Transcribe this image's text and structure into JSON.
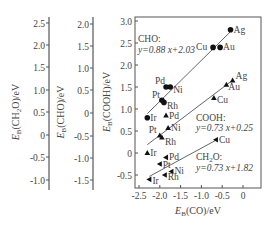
{
  "chart_data": {
    "type": "scatter",
    "title": "",
    "xlabel": "E_B(CO)/eV",
    "xlabel_main": "E",
    "xlabel_sub": "B",
    "xlabel_rest": "(CO)/eV",
    "xlim": [
      -2.5,
      0.4
    ],
    "xticks": [
      -2.5,
      -2.0,
      -1.5,
      -1.0,
      -0.5,
      0
    ],
    "xtick_labels": [
      "-2.5",
      "-2.0",
      "-1.5",
      "-1.0",
      "-0.5",
      "0"
    ],
    "axes": [
      {
        "name": "CH2O",
        "label_main": "E",
        "label_sub": "B",
        "label_rest": "(CH",
        "label_sub2": "2",
        "label_rest2": "O)/eV",
        "ylabel": "E_B(CH2O)/eV",
        "ticks": [
          "2.5",
          "2.0",
          "1.5",
          "1.0",
          "0.5",
          "0",
          "-0.5",
          "-1.0"
        ]
      },
      {
        "name": "CHO",
        "label_main": "E",
        "label_sub": "B",
        "label_rest": "(CHO)/eV",
        "ylabel": "E_B(CHO)/eV",
        "ticks": [
          "2.0",
          "1.5",
          "1.0",
          "0.5",
          "0",
          "-0.5",
          "-1.0",
          "-1.5"
        ]
      },
      {
        "name": "COOH",
        "label_main": "E",
        "label_sub": "B",
        "label_rest": "(COOH)/eV",
        "ylabel": "E_B(COOH)/eV",
        "ticks": [
          "3.0",
          "2.5",
          "2.0",
          "1.5",
          "1.0",
          "0.5",
          "0",
          "-0.5"
        ],
        "ylim": [
          -0.75,
          3.05
        ]
      }
    ],
    "series": [
      {
        "name": "CHO",
        "marker": "circle",
        "fit_label_1": "CHO:",
        "fit_label_2": "y=0.88 x+2.03",
        "fit": {
          "slope": 0.88,
          "intercept": 2.03
        },
        "points": [
          {
            "label": "Ag",
            "x": -0.3,
            "y": 2.8
          },
          {
            "label": "Au",
            "x": -0.55,
            "y": 2.4
          },
          {
            "label": "Cu",
            "x": -0.72,
            "y": 2.4
          },
          {
            "label": "Pd",
            "x": -1.85,
            "y": 1.5
          },
          {
            "label": "Ni",
            "x": -1.75,
            "y": 1.5
          },
          {
            "label": "Pt",
            "x": -1.95,
            "y": 1.2
          },
          {
            "label": "Rh",
            "x": -1.9,
            "y": 1.15
          },
          {
            "label": "Ir",
            "x": -2.3,
            "y": 0.8
          }
        ]
      },
      {
        "name": "COOH",
        "marker": "triangle-up",
        "fit_label_1": "COOH:",
        "fit_label_2": "y=0.73 x+0.25",
        "fit": {
          "slope": 0.73,
          "intercept": 0.25
        },
        "points": [
          {
            "label": "Ag",
            "x": -0.25,
            "y": 1.65
          },
          {
            "label": "Au",
            "x": -0.4,
            "y": 1.55
          },
          {
            "label": "Cu",
            "x": -0.7,
            "y": 1.25
          },
          {
            "label": "Pd",
            "x": -1.85,
            "y": 0.85
          },
          {
            "label": "Ni",
            "x": -1.8,
            "y": 0.57
          },
          {
            "label": "Pt",
            "x": -2.0,
            "y": 0.4
          },
          {
            "label": "Rh",
            "x": -1.95,
            "y": 0.35
          },
          {
            "label": "Ir",
            "x": -2.3,
            "y": 0.0
          }
        ]
      },
      {
        "name": "CH2O",
        "marker": "triangle-left",
        "fit_label_1": "CH2O:",
        "fit_label_1_main": "CH",
        "fit_label_1_sub": "2",
        "fit_label_1_rest": "O:",
        "fit_label_2": "y=0.73 x+1.82",
        "fit": {
          "slope": 0.73,
          "intercept": 1.82
        },
        "points": [
          {
            "label": "Cu",
            "x": -0.65,
            "y": 0.3
          },
          {
            "label": "Pd",
            "x": -1.85,
            "y": -0.1
          },
          {
            "label": "Pt",
            "x": -2.0,
            "y": -0.25
          },
          {
            "label": "Ni",
            "x": -1.72,
            "y": -0.42
          },
          {
            "label": "Rh",
            "x": -1.88,
            "y": -0.5
          },
          {
            "label": "Ir",
            "x": -2.25,
            "y": -0.6
          }
        ]
      }
    ],
    "grid": false,
    "legend": "none"
  }
}
